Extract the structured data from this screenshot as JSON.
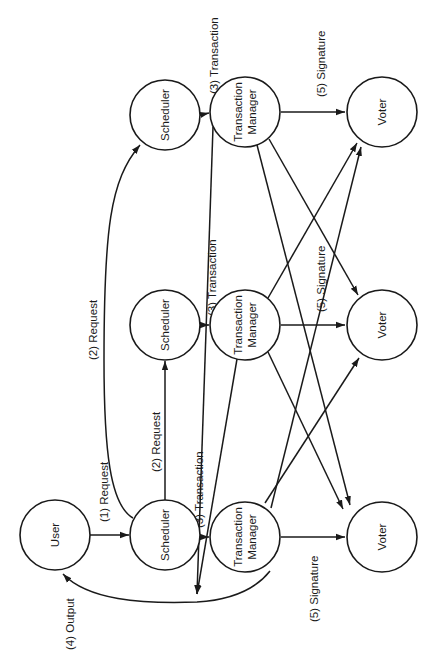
{
  "diagram": {
    "type": "flow",
    "orientation": "rotated-90-ccw",
    "colors": {
      "stroke": "#1a1a1a",
      "background": "#ffffff"
    },
    "nodes": {
      "user": {
        "label": "User"
      },
      "scheduler_1": {
        "label": "Scheduler"
      },
      "scheduler_2": {
        "label": "Scheduler"
      },
      "scheduler_3": {
        "label": "Scheduler"
      },
      "tm_1": {
        "label_line1": "Transaction",
        "label_line2": "Manager"
      },
      "tm_2": {
        "label_line1": "Transaction",
        "label_line2": "Manager"
      },
      "tm_3": {
        "label_line1": "Transaction",
        "label_line2": "Manager"
      },
      "voter_1": {
        "label": "Voter"
      },
      "voter_2": {
        "label": "Voter"
      },
      "voter_3": {
        "label": "Voter"
      }
    },
    "edge_labels": {
      "request_1": "(1) Request",
      "request_2a": "(2) Request",
      "request_2b": "(2) Request",
      "transaction_1": "(3) Transaction",
      "transaction_2": "(3) Transaction",
      "transaction_3": "(3) Transaction",
      "output": "(4) Output",
      "signature_1": "(5) Signature",
      "signature_2": "(5) Signature",
      "signature_3": "(5) Signature"
    },
    "edges": [
      {
        "from": "user",
        "to": "scheduler_1",
        "label": "(1) Request"
      },
      {
        "from": "scheduler_1",
        "to": "scheduler_2",
        "label": "(2) Request"
      },
      {
        "from": "scheduler_1",
        "to": "scheduler_3",
        "label": "(2) Request"
      },
      {
        "from": "scheduler_1",
        "to": "tm_1",
        "label": "(3) Transaction"
      },
      {
        "from": "scheduler_2",
        "to": "tm_2",
        "label": "(3) Transaction"
      },
      {
        "from": "scheduler_3",
        "to": "tm_3",
        "label": "(3) Transaction"
      },
      {
        "from": "tm_1",
        "to": "user",
        "label": "(4) Output"
      },
      {
        "from": "tm_2",
        "to": "user",
        "label": "(4) Output"
      },
      {
        "from": "tm_3",
        "to": "user",
        "label": "(4) Output"
      },
      {
        "from": "tm_1",
        "to": "voter_1",
        "label": "(5) Signature"
      },
      {
        "from": "tm_1",
        "to": "voter_2",
        "label": "(5) Signature"
      },
      {
        "from": "tm_1",
        "to": "voter_3",
        "label": "(5) Signature"
      },
      {
        "from": "tm_2",
        "to": "voter_1",
        "label": "(5) Signature"
      },
      {
        "from": "tm_2",
        "to": "voter_2",
        "label": "(5) Signature"
      },
      {
        "from": "tm_2",
        "to": "voter_3",
        "label": "(5) Signature"
      },
      {
        "from": "tm_3",
        "to": "voter_1",
        "label": "(5) Signature"
      },
      {
        "from": "tm_3",
        "to": "voter_2",
        "label": "(5) Signature"
      },
      {
        "from": "tm_3",
        "to": "voter_3",
        "label": "(5) Signature"
      }
    ]
  }
}
